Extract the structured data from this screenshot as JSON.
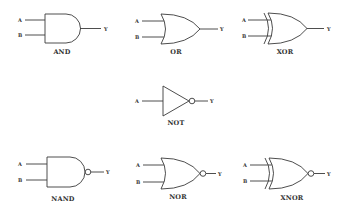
{
  "diagram": {
    "line_color": "#3a3a3a",
    "background": "#ffffff",
    "gates": [
      {
        "id": "and",
        "label": "AND",
        "inputs": [
          "A",
          "B"
        ],
        "output": "Y"
      },
      {
        "id": "or",
        "label": "OR",
        "inputs": [
          "A",
          "B"
        ],
        "output": "Y"
      },
      {
        "id": "xor",
        "label": "XOR",
        "inputs": [
          "A",
          "B"
        ],
        "output": "Y"
      },
      {
        "id": "not",
        "label": "NOT",
        "inputs": [
          "A"
        ],
        "output": "Y"
      },
      {
        "id": "nand",
        "label": "NAND",
        "inputs": [
          "A",
          "B"
        ],
        "output": "Y"
      },
      {
        "id": "nor",
        "label": "NOR",
        "inputs": [
          "A",
          "B"
        ],
        "output": "Y"
      },
      {
        "id": "xnor",
        "label": "XNOR",
        "inputs": [
          "A",
          "B"
        ],
        "output": "Y"
      }
    ]
  }
}
